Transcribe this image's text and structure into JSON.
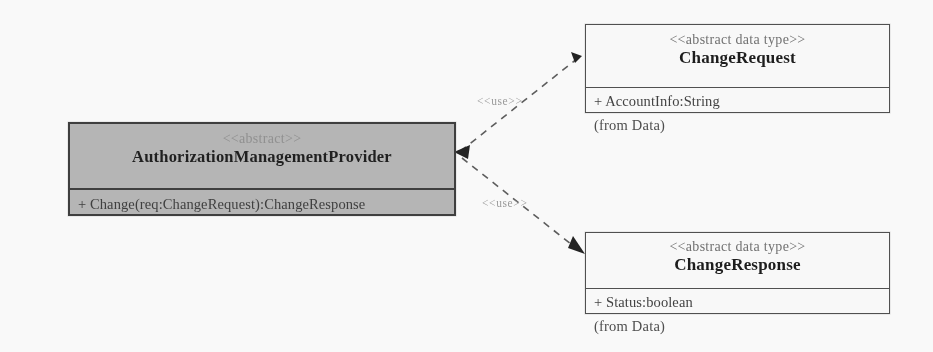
{
  "diagram": {
    "type": "uml-class-diagram",
    "title": "",
    "background_color": "#fefefe",
    "line_color": "#5a5a5a",
    "shaded_fill_color": "#b6b6b6"
  },
  "classes": [
    {
      "id": "authorization-management-provider",
      "name": "AuthorizationManagementProvider",
      "stereotype": "<<abstract>>",
      "shaded": true,
      "from_package": "",
      "members": [
        "+ Change(req:ChangeRequest):ChangeResponse"
      ]
    },
    {
      "id": "change-request",
      "name": "ChangeRequest",
      "stereotype": "<<abstract data type>>",
      "shaded": false,
      "from_package": "(from Data)",
      "members": [
        "+ AccountInfo:String"
      ]
    },
    {
      "id": "change-response",
      "name": "ChangeResponse",
      "stereotype": "<<abstract data type>>",
      "shaded": false,
      "from_package": "(from Data)",
      "members": [
        "+ Status:boolean"
      ]
    }
  ],
  "relationships": [
    {
      "id": "use-change-request",
      "label": "<<use>>",
      "kind": "dependency",
      "from": "change-request",
      "to": "authorization-management-provider"
    },
    {
      "id": "use-change-response",
      "label": "<<use>>",
      "kind": "dependency",
      "from": "authorization-management-provider",
      "to": "change-response"
    }
  ]
}
